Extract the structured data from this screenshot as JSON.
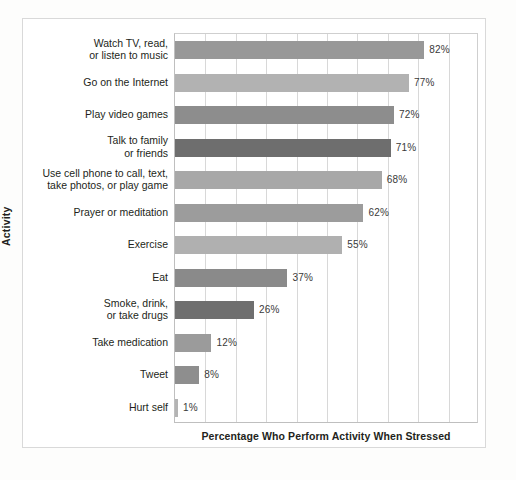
{
  "chart_data": {
    "type": "bar",
    "orientation": "horizontal",
    "title": "",
    "xlabel": "Percentage Who Perform Activity When Stressed",
    "ylabel": "Activity",
    "xlim": [
      0,
      100
    ],
    "grid": true,
    "legend": "none",
    "gridline_step": 10,
    "categories": [
      "Watch TV, read,\nor listen to music",
      "Go on the Internet",
      "Play video games",
      "Talk to family\nor friends",
      "Use cell phone to call, text,\ntake photos, or play game",
      "Prayer or meditation",
      "Exercise",
      "Eat",
      "Smoke, drink,\nor take drugs",
      "Take medication",
      "Tweet",
      "Hurt self"
    ],
    "values": [
      82,
      77,
      72,
      71,
      68,
      62,
      55,
      37,
      26,
      12,
      8,
      1
    ],
    "value_labels": [
      "82%",
      "77%",
      "72%",
      "71%",
      "68%",
      "62%",
      "55%",
      "37%",
      "26%",
      "12%",
      "8%",
      "1%"
    ],
    "bar_colors": [
      "#989898",
      "#b2b2b2",
      "#8d8d8d",
      "#6e6e6e",
      "#a8a8a8",
      "#9c9c9c",
      "#b0b0b0",
      "#8a8a8a",
      "#6f6f6f",
      "#9b9b9b",
      "#8e8e8e",
      "#b4b4b4"
    ]
  },
  "colors": {
    "frame_border": "#d9d9d9",
    "plot_border": "#bfbfbf",
    "gridline": "#d8d8d8",
    "text": "#231f20",
    "value_text": "#3a3a3a",
    "background": "#ffffff"
  }
}
